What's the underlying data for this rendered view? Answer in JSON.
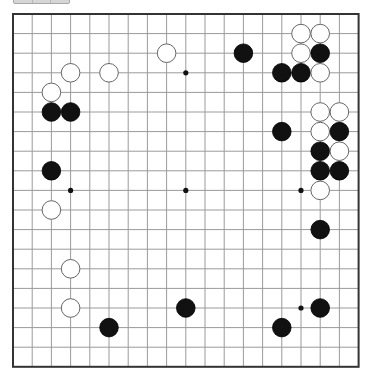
{
  "toolbar": {
    "segments": 3
  },
  "board": {
    "size": 19,
    "origin_x": 13,
    "origin_y": 14,
    "step_x": 19.2,
    "step_y": 19.6,
    "stone_radius": 9.3,
    "colors": {
      "background": "#ffffff",
      "grid_line": "#9a9a9a",
      "border": "#333333",
      "black_stone": "#111111",
      "white_stone_fill": "#ffffff",
      "white_stone_stroke": "#666666",
      "hoshi": "#111111"
    },
    "hoshi": [
      [
        3,
        3
      ],
      [
        9,
        3
      ],
      [
        15,
        3
      ],
      [
        3,
        9
      ],
      [
        9,
        9
      ],
      [
        15,
        9
      ],
      [
        3,
        15
      ],
      [
        9,
        15
      ],
      [
        15,
        15
      ]
    ],
    "stones": [
      {
        "color": "white",
        "x": 15,
        "y": 1
      },
      {
        "color": "white",
        "x": 16,
        "y": 1
      },
      {
        "color": "white",
        "x": 15,
        "y": 2
      },
      {
        "color": "black",
        "x": 16,
        "y": 2
      },
      {
        "color": "black",
        "x": 12,
        "y": 2
      },
      {
        "color": "white",
        "x": 8,
        "y": 2
      },
      {
        "color": "black",
        "x": 14,
        "y": 3
      },
      {
        "color": "black",
        "x": 15,
        "y": 3
      },
      {
        "color": "white",
        "x": 16,
        "y": 3
      },
      {
        "color": "white",
        "x": 3,
        "y": 3
      },
      {
        "color": "white",
        "x": 5,
        "y": 3
      },
      {
        "color": "white",
        "x": 2,
        "y": 4
      },
      {
        "color": "black",
        "x": 2,
        "y": 5
      },
      {
        "color": "black",
        "x": 3,
        "y": 5
      },
      {
        "color": "white",
        "x": 16,
        "y": 5
      },
      {
        "color": "white",
        "x": 17,
        "y": 5
      },
      {
        "color": "black",
        "x": 14,
        "y": 6
      },
      {
        "color": "white",
        "x": 16,
        "y": 6
      },
      {
        "color": "black",
        "x": 17,
        "y": 6
      },
      {
        "color": "black",
        "x": 16,
        "y": 7
      },
      {
        "color": "white",
        "x": 17,
        "y": 7
      },
      {
        "color": "black",
        "x": 2,
        "y": 8
      },
      {
        "color": "black",
        "x": 16,
        "y": 8
      },
      {
        "color": "black",
        "x": 17,
        "y": 8
      },
      {
        "color": "white",
        "x": 16,
        "y": 9
      },
      {
        "color": "white",
        "x": 2,
        "y": 10
      },
      {
        "color": "black",
        "x": 16,
        "y": 11
      },
      {
        "color": "white",
        "x": 3,
        "y": 13
      },
      {
        "color": "white",
        "x": 3,
        "y": 15
      },
      {
        "color": "black",
        "x": 9,
        "y": 15
      },
      {
        "color": "black",
        "x": 16,
        "y": 15
      },
      {
        "color": "black",
        "x": 5,
        "y": 16
      },
      {
        "color": "black",
        "x": 14,
        "y": 16
      }
    ]
  }
}
